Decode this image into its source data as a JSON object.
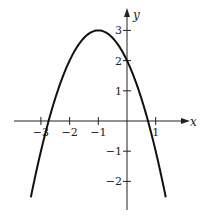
{
  "chart_data": {
    "type": "line",
    "title": "",
    "xlabel": "x",
    "ylabel": "y",
    "function": "y = -x^2 - 2x + 2",
    "vertex": [
      -1,
      3
    ],
    "y_intercept": 2,
    "x_intercepts": [
      -2.732,
      0.732
    ],
    "xlim": [
      -3.7,
      1.6
    ],
    "ylim": [
      -2.8,
      3.4
    ],
    "x_ticks": [
      -3,
      -2,
      -1,
      1
    ],
    "x_tick_labels": [
      "−3",
      "−2",
      "−1",
      "1"
    ],
    "y_ticks": [
      3,
      2,
      1,
      -1,
      -2
    ],
    "y_tick_labels": [
      "3",
      "2",
      "1",
      "−1",
      "−2"
    ],
    "grid": false,
    "legend": null,
    "series": [
      {
        "name": "parabola",
        "x": [
          -3.35,
          -3,
          -2.5,
          -2,
          -1.5,
          -1,
          -0.5,
          0,
          0.5,
          1,
          1.35
        ],
        "y": [
          -2.52,
          -1,
          0.75,
          2,
          2.75,
          3,
          2.75,
          2,
          0.75,
          -1,
          -2.52
        ]
      }
    ]
  },
  "colors": {
    "curve": "#111111",
    "axis": "#222222",
    "background": "#ffffff"
  }
}
